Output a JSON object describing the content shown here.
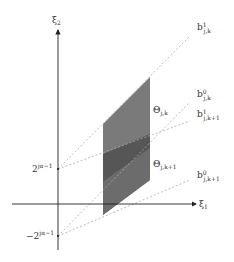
{
  "diagram": {
    "axes": {
      "x_label": "ξ",
      "x_label_sub": "1",
      "y_label": "ξ",
      "y_label_sub": "2"
    },
    "ticks": {
      "pos_tick_base": "2",
      "pos_tick_exp": "jα−1",
      "neg_tick_base": "−2",
      "neg_tick_exp": "jα−1"
    },
    "regions": {
      "theta_jk": {
        "symbol": "Θ",
        "sub": "j,k"
      },
      "theta_jk1": {
        "symbol": "Θ",
        "sub": "j,k+1"
      }
    },
    "lines": {
      "b1_jk": {
        "symbol": "b",
        "sup": "1",
        "sub": "j,k"
      },
      "b0_jk": {
        "symbol": "b",
        "sup": "0",
        "sub": "j,k"
      },
      "b1_jk1": {
        "symbol": "b",
        "sup": "1",
        "sub": "j,k+1"
      },
      "b0_jk1": {
        "symbol": "b",
        "sup": "0",
        "sub": "j,k+1"
      }
    },
    "colors": {
      "region_light": "#7a7a7a",
      "region_dark": "#555555",
      "axis": "#222222",
      "dashed": "#aaaaaa"
    }
  }
}
